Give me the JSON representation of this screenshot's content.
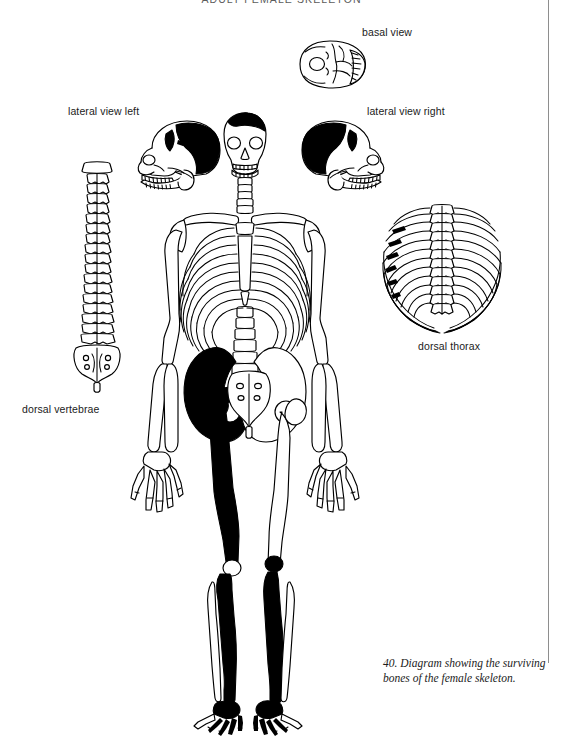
{
  "running_head": "ADULT FEMALE SKELETON",
  "labels": {
    "basal_view": "basal view",
    "lateral_view_left": "lateral view left",
    "lateral_view_right": "lateral view right",
    "dorsal_thorax": "dorsal thorax",
    "dorsal_vertebrae": "dorsal vertebrae"
  },
  "caption": {
    "number": "40.",
    "text": "40. Diagram showing the surviving bones of the female skeleton."
  },
  "figure": {
    "legend_convention": "solid black = surviving bone; outline = missing bone",
    "colors": {
      "surviving_bone": "#000000",
      "missing_bone_outline": "#000000",
      "missing_bone_fill": "#ffffff",
      "paper": "#ffffff",
      "margin_rule": "#8e8e8e"
    },
    "panels": [
      {
        "name": "basal-view-skull",
        "label": "basal view",
        "shading": "outline"
      },
      {
        "name": "lateral-view-left-skull",
        "label": "lateral view left",
        "shading": "partial-black-cranial-vault"
      },
      {
        "name": "lateral-view-right-skull",
        "label": "lateral view right",
        "shading": "partial-black-cranial-vault"
      },
      {
        "name": "dorsal-vertebrae-column",
        "label": "dorsal vertebrae",
        "shading": "outline"
      },
      {
        "name": "dorsal-thorax-ribcage",
        "label": "dorsal thorax",
        "shading": "outline-with-black-rib-fragments"
      },
      {
        "name": "full-skeleton",
        "label": "",
        "shading": "mixed"
      }
    ],
    "surviving_bones": [
      "skull vault (partial)",
      "left innominate",
      "left femur",
      "left tibia",
      "right tibia",
      "left foot (partial)",
      "right foot (partial)",
      "rib fragments"
    ]
  }
}
